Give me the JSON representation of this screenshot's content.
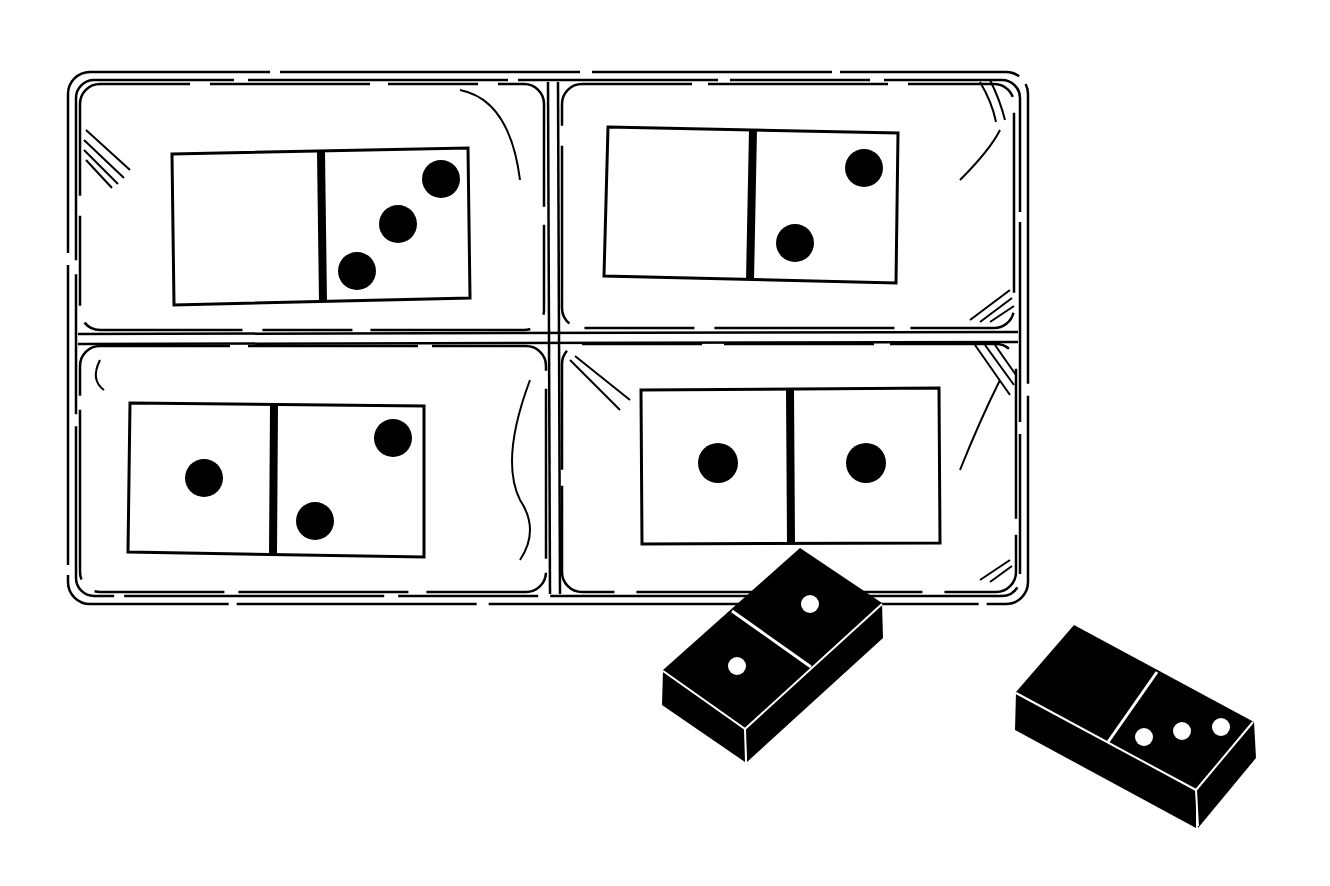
{
  "scene": {
    "description": "Line drawing of a tray with four domino cards and two loose black dominoes",
    "colors": {
      "ink": "#000000",
      "paper": "#ffffff"
    }
  },
  "tray": {
    "cards": [
      {
        "position": "top-left",
        "left_pips": 0,
        "right_pips": 3
      },
      {
        "position": "top-right",
        "left_pips": 0,
        "right_pips": 2
      },
      {
        "position": "bottom-left",
        "left_pips": 1,
        "right_pips": 2
      },
      {
        "position": "bottom-right",
        "left_pips": 1,
        "right_pips": 1
      }
    ]
  },
  "loose_dominoes": [
    {
      "position": "center",
      "left_pips": 1,
      "right_pips": 1
    },
    {
      "position": "right",
      "left_pips": 0,
      "right_pips": 3
    }
  ]
}
